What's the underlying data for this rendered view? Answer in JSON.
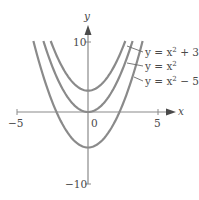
{
  "chart_data": {
    "type": "line",
    "title": "",
    "xlabel": "x",
    "ylabel": "y",
    "xlim": [
      -5,
      5
    ],
    "ylim": [
      -10,
      10
    ],
    "x_ticks": [
      -5,
      0,
      5
    ],
    "x_tick_labels": [
      "−5",
      "0",
      "5"
    ],
    "y_ticks": [
      -10,
      10
    ],
    "y_tick_labels": [
      "−10",
      "10"
    ],
    "grid": false,
    "series": [
      {
        "name": "y = x² + 3",
        "formula": "x^2 + 3",
        "shift": 3
      },
      {
        "name": "y = x²",
        "formula": "x^2",
        "shift": 0
      },
      {
        "name": "y = x² − 5",
        "formula": "x^2 - 5",
        "shift": -5
      }
    ],
    "colors": {
      "curve": "#8a8a8a",
      "axis": "#8a8a8a",
      "text": "#4a4a4a"
    }
  },
  "labels": {
    "x_axis": "x",
    "y_axis": "y",
    "tick_neg5": "−5",
    "tick_0": "0",
    "tick_5": "5",
    "tick_10": "10",
    "tick_neg10": "−10"
  }
}
